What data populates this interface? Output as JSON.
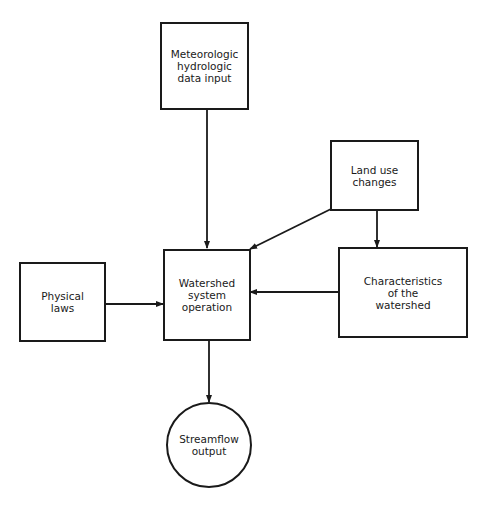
{
  "diagram": {
    "nodes": {
      "meteo": {
        "label": "Meteorologic\nhydrologic\ndata input",
        "shape": "rectangle"
      },
      "landuse": {
        "label": "Land use\nchanges",
        "shape": "rectangle"
      },
      "physical": {
        "label": "Physical\nlaws",
        "shape": "rectangle"
      },
      "watershed": {
        "label": "Watershed\nsystem\noperation",
        "shape": "rectangle"
      },
      "characteristics": {
        "label": "Characteristics\nof the\nwatershed",
        "shape": "rectangle"
      },
      "streamflow": {
        "label": "Streamflow\noutput",
        "shape": "circle"
      }
    },
    "edges": [
      {
        "from": "meteo",
        "to": "watershed"
      },
      {
        "from": "landuse",
        "to": "watershed"
      },
      {
        "from": "landuse",
        "to": "characteristics"
      },
      {
        "from": "physical",
        "to": "watershed"
      },
      {
        "from": "characteristics",
        "to": "watershed"
      },
      {
        "from": "watershed",
        "to": "streamflow"
      }
    ],
    "colors": {
      "stroke": "#1a1a1a",
      "background": "#ffffff"
    }
  }
}
